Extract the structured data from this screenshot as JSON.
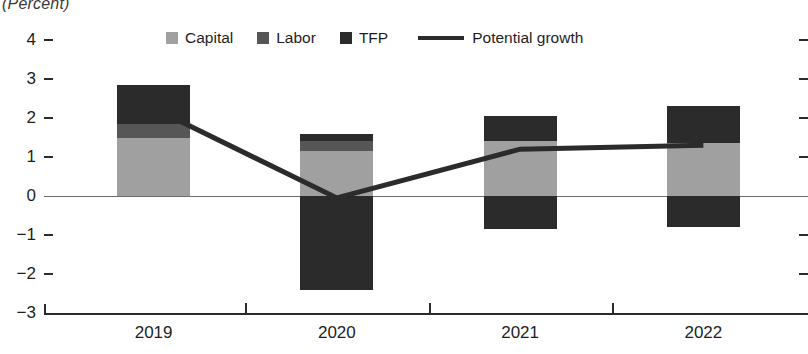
{
  "title": "(Percent)",
  "legend": {
    "items": [
      {
        "label": "Capital",
        "type": "swatch",
        "color": "#a0a0a0"
      },
      {
        "label": "Labor",
        "type": "swatch",
        "color": "#565656"
      },
      {
        "label": "TFP",
        "type": "swatch",
        "color": "#2b2b2b"
      },
      {
        "label": "Potential growth",
        "type": "line",
        "color": "#2b2b2b"
      }
    ]
  },
  "axes": {
    "y_ticks": [
      "4",
      "3",
      "2",
      "1",
      "0",
      "−1",
      "−2",
      "−3"
    ],
    "x_ticks": [
      "2019",
      "2020",
      "2021",
      "2022"
    ]
  },
  "chart_data": {
    "type": "bar",
    "title": "(Percent)",
    "subtitle": "",
    "xlabel": "",
    "ylabel": "",
    "ylim": [
      -3,
      4
    ],
    "grid": false,
    "legend_position": "top-center",
    "stacked": true,
    "categories": [
      "2019",
      "2020",
      "2021",
      "2022"
    ],
    "series": [
      {
        "name": "Capital",
        "color": "#a0a0a0",
        "values": [
          1.48,
          1.15,
          1.4,
          1.35
        ]
      },
      {
        "name": "Labor",
        "color": "#565656",
        "values": [
          0.37,
          0.25,
          0.0,
          0.0
        ]
      },
      {
        "name": "TFP",
        "color": "#2b2b2b",
        "values": [
          1.0,
          0.2,
          0.65,
          0.95
        ]
      },
      {
        "name": "TFP (negative)",
        "color": "#2b2b2b",
        "values": [
          0.0,
          -2.4,
          -0.85,
          -0.8
        ]
      }
    ],
    "line_series": {
      "name": "Potential growth",
      "color": "#2b2b2b",
      "values": [
        2.25,
        -0.05,
        1.2,
        1.3
      ]
    },
    "bar_totals_positive": [
      2.85,
      1.6,
      2.05,
      2.3
    ],
    "bar_totals_negative": [
      0.0,
      -2.4,
      -0.85,
      -0.8
    ]
  }
}
